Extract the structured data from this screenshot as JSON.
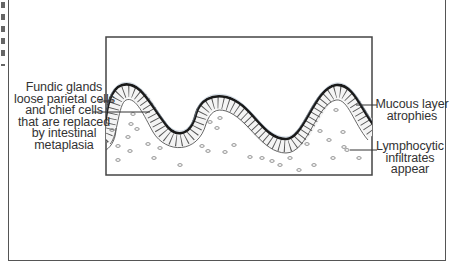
{
  "diagram": {
    "labels": {
      "fundic_glands": {
        "lines": [
          "Fundic glands",
          "loose parietal cells",
          "and chief cells",
          "that are replaced",
          "by intestinal",
          "metaplasia"
        ]
      },
      "mucous_layer": {
        "lines": [
          "Mucous layer",
          "atrophies"
        ]
      },
      "lymphocytic": {
        "lines": [
          "Lymphocytic",
          "infiltrates",
          "appear"
        ]
      }
    },
    "colors": {
      "line": "#333333",
      "mucous_layer": "#1a1a1a",
      "frame": "#555555",
      "background": "#ffffff"
    }
  }
}
